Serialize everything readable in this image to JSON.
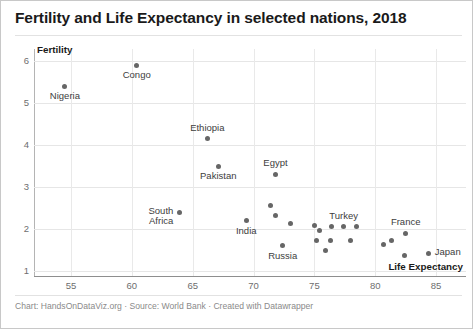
{
  "chart": {
    "title": "Fertility and Life Expectancy in selected nations, 2018",
    "footer": "Chart: HandsOnDataViz.org · Source: World Bank · Created with Datawrapper"
  },
  "axis": {
    "y_title": "Fertility",
    "x_title": "Life Expectancy"
  },
  "chart_data": {
    "type": "scatter",
    "title": "Fertility and Life Expectancy in selected nations, 2018",
    "xlabel": "Life Expectancy",
    "ylabel": "Fertility",
    "xlim": [
      52.5,
      87.0
    ],
    "ylim": [
      0.85,
      6.35
    ],
    "xticks": [
      55,
      60,
      65,
      70,
      75,
      80,
      85
    ],
    "yticks": [
      1,
      2,
      3,
      4,
      5,
      6
    ],
    "grid": true,
    "legend": "none",
    "points": [
      {
        "label": "Nigeria",
        "x": 54.5,
        "y": 5.4,
        "label_pos": "below"
      },
      {
        "label": "Congo",
        "x": 60.4,
        "y": 5.9,
        "label_pos": "below"
      },
      {
        "label": "Ethiopia",
        "x": 66.2,
        "y": 4.15,
        "label_pos": "above"
      },
      {
        "label": "Pakistan",
        "x": 67.1,
        "y": 3.5,
        "label_pos": "below"
      },
      {
        "label": "Egypt",
        "x": 71.8,
        "y": 3.3,
        "label_pos": "above"
      },
      {
        "label": "South Africa",
        "x": 63.9,
        "y": 2.4,
        "label_pos": "left"
      },
      {
        "label": "India",
        "x": 69.4,
        "y": 2.2,
        "label_pos": "below"
      },
      {
        "label": "Russia",
        "x": 72.4,
        "y": 1.6,
        "label_pos": "below"
      },
      {
        "label": "Turkey",
        "x": 77.4,
        "y": 2.05,
        "label_pos": "above"
      },
      {
        "label": "France",
        "x": 82.5,
        "y": 1.9,
        "label_pos": "above"
      },
      {
        "label": "Japan",
        "x": 84.4,
        "y": 1.42,
        "label_pos": "right"
      },
      {
        "label": "",
        "x": 71.4,
        "y": 2.55,
        "label_pos": "none"
      },
      {
        "label": "",
        "x": 71.8,
        "y": 2.32,
        "label_pos": "none"
      },
      {
        "label": "",
        "x": 73.0,
        "y": 2.12,
        "label_pos": "none"
      },
      {
        "label": "",
        "x": 75.0,
        "y": 2.08,
        "label_pos": "none"
      },
      {
        "label": "",
        "x": 75.4,
        "y": 1.97,
        "label_pos": "none"
      },
      {
        "label": "",
        "x": 76.4,
        "y": 2.05,
        "label_pos": "none"
      },
      {
        "label": "",
        "x": 78.5,
        "y": 2.05,
        "label_pos": "none"
      },
      {
        "label": "",
        "x": 75.2,
        "y": 1.72,
        "label_pos": "none"
      },
      {
        "label": "",
        "x": 76.3,
        "y": 1.72,
        "label_pos": "none"
      },
      {
        "label": "",
        "x": 78.0,
        "y": 1.72,
        "label_pos": "none"
      },
      {
        "label": "",
        "x": 75.9,
        "y": 1.48,
        "label_pos": "none"
      },
      {
        "label": "",
        "x": 81.3,
        "y": 1.72,
        "label_pos": "none"
      },
      {
        "label": "",
        "x": 80.7,
        "y": 1.62,
        "label_pos": "none"
      },
      {
        "label": "",
        "x": 82.4,
        "y": 1.38,
        "label_pos": "none"
      }
    ]
  }
}
